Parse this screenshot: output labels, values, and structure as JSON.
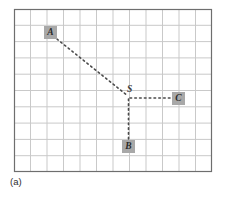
{
  "figure": {
    "caption": "(a)",
    "grid": {
      "columns": 12,
      "rows": 10,
      "left": 14,
      "top": 9,
      "right": 212,
      "bottom": 172,
      "cell_width": 16.5,
      "cell_height": 16.3,
      "line_color": "#c9c9c9",
      "border_color": "#6e6e6e",
      "background": "#ffffff"
    },
    "node_fill_color": "#a8a8a8",
    "node_text_color": "#2a2a2a",
    "edge_color": "#4a4a4a",
    "nodes": [
      {
        "id": "A",
        "label": "A",
        "x": 44,
        "y": 26,
        "boxed": true
      },
      {
        "id": "S",
        "label": "S",
        "x": 127,
        "y": 85,
        "boxed": false
      },
      {
        "id": "C",
        "label": "C",
        "x": 172,
        "y": 92,
        "boxed": true
      },
      {
        "id": "B",
        "label": "B",
        "x": 122,
        "y": 140,
        "boxed": true
      }
    ],
    "edges": [
      {
        "id": "edge-a-s",
        "from": "A",
        "to": "S",
        "style": "dotted",
        "x1": 57,
        "y1": 39,
        "x2": 128,
        "y2": 96
      },
      {
        "id": "edge-s-c",
        "from": "S",
        "to": "C",
        "style": "dotted",
        "x1": 130,
        "y1": 98,
        "x2": 172,
        "y2": 98
      },
      {
        "id": "edge-s-b",
        "from": "S",
        "to": "B",
        "style": "dotted",
        "x1": 128,
        "y1": 99,
        "x2": 128,
        "y2": 140
      }
    ]
  }
}
